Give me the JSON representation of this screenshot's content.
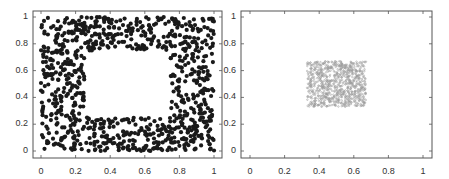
{
  "chart_data": [
    {
      "type": "scatter",
      "title": "",
      "xlabel": "",
      "ylabel": "",
      "xlim": [
        0,
        1
      ],
      "ylim": [
        0,
        1
      ],
      "grid": false,
      "x_ticks": [
        "0",
        "0.2",
        "0.4",
        "0.6",
        "0.8",
        "1"
      ],
      "y_ticks": [
        "0",
        "0.2",
        "0.4",
        "0.6",
        "0.8",
        "1"
      ],
      "description": "Dense black points uniformly filling the unit square except a central empty rectangular hole",
      "hole": {
        "x": [
          0.25,
          0.75
        ],
        "y": [
          0.25,
          0.75
        ]
      },
      "point_count_approx": 900,
      "marker_color": "#1a1a1a",
      "marker_size": "large filled dots"
    },
    {
      "type": "scatter",
      "title": "",
      "xlabel": "",
      "ylabel": "",
      "xlim": [
        0,
        1
      ],
      "ylim": [
        0,
        1
      ],
      "grid": false,
      "x_ticks": [
        "0",
        "0.2",
        "0.4",
        "0.6",
        "0.8",
        "1"
      ],
      "y_ticks": [
        "0",
        "0.2",
        "0.4",
        "0.6",
        "0.8",
        "1"
      ],
      "description": "Small light-gray points concentrated in a central square region",
      "region": {
        "x": [
          0.33,
          0.67
        ],
        "y": [
          0.33,
          0.67
        ]
      },
      "point_count_approx": 900,
      "marker_color": "#9a9a9a",
      "marker_size": "small"
    }
  ]
}
